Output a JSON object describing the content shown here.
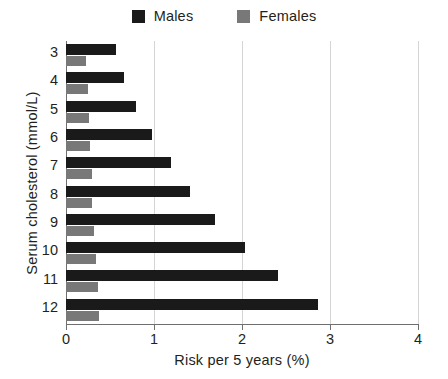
{
  "chart_data": {
    "type": "bar",
    "orientation": "horizontal",
    "title": "",
    "xlabel": "Risk per 5 years (%)",
    "ylabel": "Serum cholesterol (mmol/L)",
    "categories": [
      "3",
      "4",
      "5",
      "6",
      "7",
      "8",
      "9",
      "10",
      "11",
      "12"
    ],
    "series": [
      {
        "name": "Males",
        "color": "#1a1a1a",
        "values": [
          0.57,
          0.66,
          0.8,
          0.98,
          1.19,
          1.41,
          1.69,
          2.03,
          2.41,
          2.86
        ]
      },
      {
        "name": "Females",
        "color": "#787878",
        "values": [
          0.23,
          0.25,
          0.26,
          0.27,
          0.29,
          0.3,
          0.32,
          0.34,
          0.36,
          0.38
        ]
      }
    ],
    "xlim": [
      0,
      4
    ],
    "xticks": [
      "0",
      "1",
      "2",
      "3",
      "4"
    ],
    "grid": "vertical",
    "legend_position": "top-center"
  },
  "legend": {
    "entries": [
      {
        "label": "Males",
        "swatch": "males-swatch"
      },
      {
        "label": "Females",
        "swatch": "females-swatch"
      }
    ]
  },
  "colors": {
    "males": "#1a1a1a",
    "females": "#787878",
    "grid": "#d4d4d4",
    "axis": "#6f6f6f",
    "text": "#231f20",
    "background": "#ffffff"
  }
}
